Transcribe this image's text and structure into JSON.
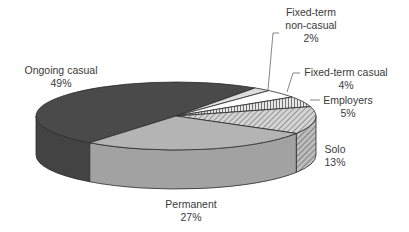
{
  "chart_data": {
    "type": "pie",
    "style": "3d",
    "title": "",
    "legend": "none",
    "slices": [
      {
        "label": "Ongoing casual",
        "value": 49,
        "display": "49%",
        "color": "#4a4a4a",
        "pattern": "solid"
      },
      {
        "label": "Fixed-term non-casual",
        "value": 2,
        "display": "2%",
        "color": "#dcdcdc",
        "pattern": "solid"
      },
      {
        "label": "Fixed-term casual",
        "value": 4,
        "display": "4%",
        "color": "#ffffff",
        "pattern": "solid"
      },
      {
        "label": "Employers",
        "value": 5,
        "display": "5%",
        "color": "#d8d8d8",
        "pattern": "vertical-lines"
      },
      {
        "label": "Solo",
        "value": 13,
        "display": "13%",
        "color": "#c8c8c8",
        "pattern": "diagonal-lines"
      },
      {
        "label": "Permanent",
        "value": 27,
        "display": "27%",
        "color": "#b4b4b4",
        "pattern": "solid"
      }
    ]
  },
  "labels": {
    "ongoing": {
      "name": "Ongoing casual",
      "pct": "49%"
    },
    "fixed_noncasual": {
      "name1": "Fixed-term",
      "name2": "non-casual",
      "pct": "2%"
    },
    "fixed_casual": {
      "name": "Fixed-term casual",
      "pct": "4%"
    },
    "employers": {
      "name": "Employers",
      "pct": "5%"
    },
    "solo": {
      "name": "Solo",
      "pct": "13%"
    },
    "permanent": {
      "name": "Permanent",
      "pct": "27%"
    }
  }
}
